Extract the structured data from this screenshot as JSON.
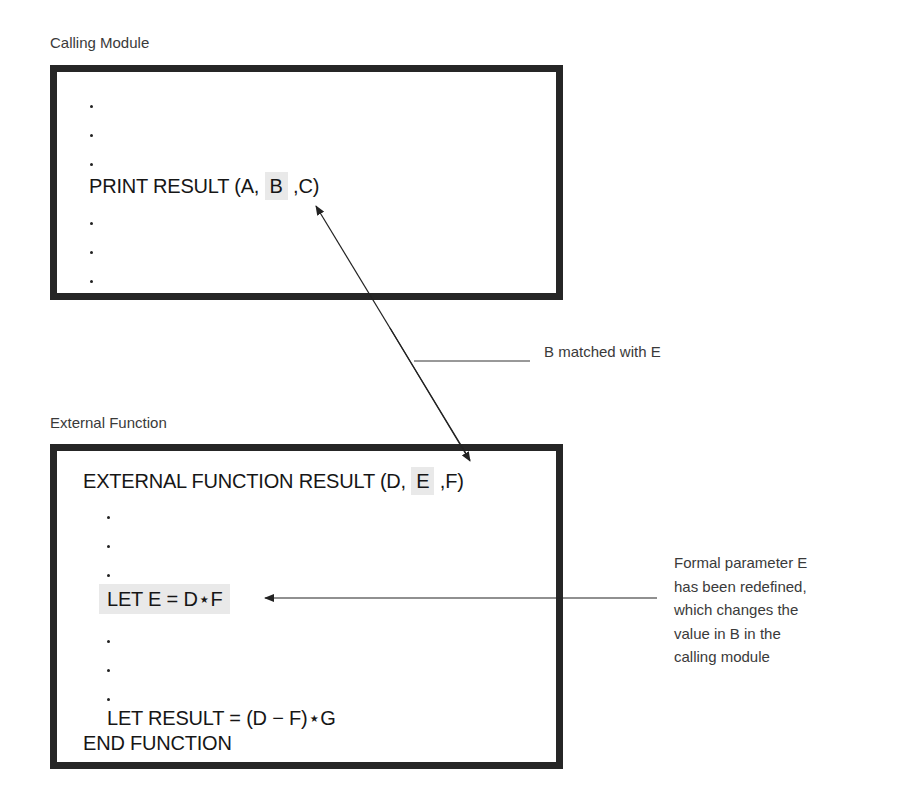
{
  "calling_module": {
    "caption": "Calling Module",
    "code": {
      "prefix": "PRINT RESULT (A, ",
      "highlighted_arg": "B",
      "suffix": " ,C)"
    },
    "ellipsis_dots_before": 3,
    "ellipsis_dots_after": 3
  },
  "external_function": {
    "caption": "External Function",
    "header": {
      "prefix": "EXTERNAL FUNCTION RESULT (D, ",
      "highlighted_arg": "E",
      "suffix": " ,F)"
    },
    "redefine_line": "LET E = D⋆F",
    "result_line": "LET RESULT = (D − F)⋆G",
    "end_line": "END FUNCTION"
  },
  "annotations": {
    "match_label": "B matched with E",
    "redefine_note": [
      "Formal parameter E",
      "has been redefined,",
      "which changes the",
      "value in B in the",
      "calling module"
    ]
  },
  "colors": {
    "box_border": "#262626",
    "highlight": "#e9e9e9",
    "text": "#161616",
    "caption": "#3a3a3a"
  }
}
